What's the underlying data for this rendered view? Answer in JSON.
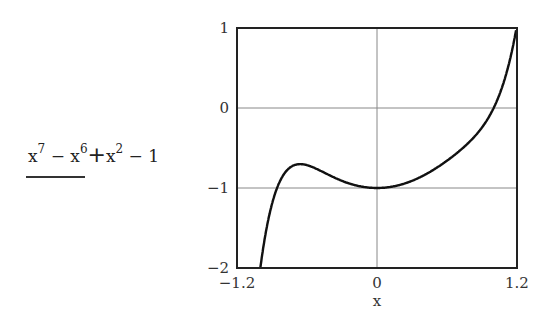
{
  "expression": {
    "t1": "x",
    "e1": "7",
    "op1": " − ",
    "t2": "x",
    "e2": "6",
    "op2": "+",
    "t3": "x",
    "e3": "2",
    "op3": " − 1"
  },
  "chart_data": {
    "type": "line",
    "title": "",
    "xlabel": "x",
    "ylabel": "x^7 - x^6 + x^2 - 1",
    "function": "x^7 - x^6 + x^2 - 1",
    "xlim": [
      -1.2,
      1.2
    ],
    "ylim": [
      -2,
      1
    ],
    "grid": "zero-lines",
    "x_ticks": [
      "-1.2",
      "0",
      "1.2"
    ],
    "y_ticks": [
      "1",
      "0",
      "-1",
      "-2"
    ],
    "series": [
      {
        "name": "f(x)",
        "x": [
          -1.1,
          -1.0,
          -0.9,
          -0.8,
          -0.7,
          -0.6,
          -0.4,
          -0.2,
          0,
          0.2,
          0.4,
          0.6,
          0.8,
          1.0,
          1.1,
          1.2
        ],
        "values": [
          -2.0,
          -1.0,
          -0.71,
          -0.73,
          -0.79,
          -0.85,
          -0.85,
          -0.96,
          -1.0,
          -0.96,
          -0.84,
          -0.66,
          -0.38,
          0.0,
          0.3,
          1.0
        ]
      }
    ]
  },
  "colors": {
    "curve": "#111111",
    "axes": "#222222",
    "grid": "#888888"
  }
}
